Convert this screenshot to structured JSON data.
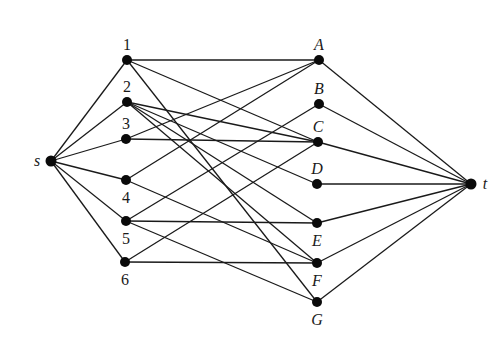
{
  "diagram": {
    "type": "bipartite flow network",
    "nodes": [
      {
        "id": "s",
        "label": "s",
        "x": 51,
        "y": 161,
        "label_pos": "left",
        "italic": true
      },
      {
        "id": "1",
        "label": "1",
        "x": 127,
        "y": 60,
        "label_pos": "top",
        "italic": false
      },
      {
        "id": "2",
        "label": "2",
        "x": 127,
        "y": 102,
        "label_pos": "top",
        "italic": false
      },
      {
        "id": "3",
        "label": "3",
        "x": 126,
        "y": 139,
        "label_pos": "top",
        "italic": false
      },
      {
        "id": "4",
        "label": "4",
        "x": 126,
        "y": 180,
        "label_pos": "bottom",
        "italic": false
      },
      {
        "id": "5",
        "label": "5",
        "x": 126,
        "y": 221,
        "label_pos": "bottom",
        "italic": false
      },
      {
        "id": "6",
        "label": "6",
        "x": 125,
        "y": 262,
        "label_pos": "bottom",
        "italic": false
      },
      {
        "id": "A",
        "label": "A",
        "x": 319,
        "y": 60,
        "label_pos": "top",
        "italic": true
      },
      {
        "id": "B",
        "label": "B",
        "x": 319,
        "y": 104,
        "label_pos": "top",
        "italic": true
      },
      {
        "id": "C",
        "label": "C",
        "x": 318,
        "y": 142,
        "label_pos": "top",
        "italic": true
      },
      {
        "id": "D",
        "label": "D",
        "x": 317,
        "y": 184,
        "label_pos": "top",
        "italic": true
      },
      {
        "id": "E",
        "label": "E",
        "x": 317,
        "y": 223,
        "label_pos": "bottom",
        "italic": true
      },
      {
        "id": "F",
        "label": "F",
        "x": 317,
        "y": 263,
        "label_pos": "bottom",
        "italic": true
      },
      {
        "id": "G",
        "label": "G",
        "x": 317,
        "y": 302,
        "label_pos": "bottom",
        "italic": true
      },
      {
        "id": "t",
        "label": "t",
        "x": 471,
        "y": 184,
        "label_pos": "right",
        "italic": true
      }
    ],
    "edges": [
      [
        "s",
        "1"
      ],
      [
        "s",
        "2"
      ],
      [
        "s",
        "3"
      ],
      [
        "s",
        "4"
      ],
      [
        "s",
        "5"
      ],
      [
        "s",
        "6"
      ],
      [
        "1",
        "A"
      ],
      [
        "1",
        "C"
      ],
      [
        "1",
        "G"
      ],
      [
        "2",
        "C"
      ],
      [
        "2",
        "D"
      ],
      [
        "2",
        "E"
      ],
      [
        "2",
        "F"
      ],
      [
        "3",
        "A"
      ],
      [
        "3",
        "C"
      ],
      [
        "4",
        "A"
      ],
      [
        "4",
        "F"
      ],
      [
        "5",
        "B"
      ],
      [
        "5",
        "E"
      ],
      [
        "5",
        "G"
      ],
      [
        "6",
        "C"
      ],
      [
        "6",
        "F"
      ],
      [
        "A",
        "t"
      ],
      [
        "B",
        "t"
      ],
      [
        "C",
        "t"
      ],
      [
        "D",
        "t"
      ],
      [
        "E",
        "t"
      ],
      [
        "F",
        "t"
      ],
      [
        "G",
        "t"
      ]
    ]
  }
}
